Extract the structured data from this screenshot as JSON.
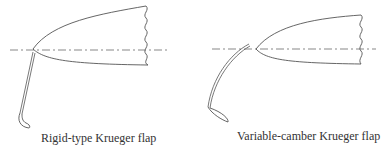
{
  "figure": {
    "panels": [
      {
        "id": "rigid",
        "caption": "Rigid-type Krueger flap"
      },
      {
        "id": "variable",
        "caption": "Variable-camber Krueger flap"
      }
    ],
    "colors": {
      "line": "#555555",
      "text": "#333333",
      "background": "#ffffff"
    }
  }
}
